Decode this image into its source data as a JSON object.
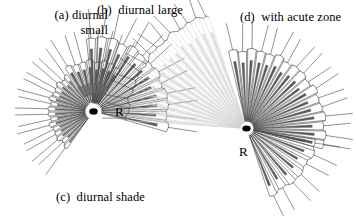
{
  "figure": {
    "background_color": "#ffffff",
    "ink_color": "#000000",
    "line_color": "#3a3a3a",
    "pale_ray_color": "#cfcfcf",
    "shade_fill_color": "#6e6e6e",
    "width": 356,
    "height": 216
  },
  "captions": [
    {
      "id": "a",
      "name": "caption-a-diurnal-small",
      "line1": "(a) diurnal",
      "line2": "small",
      "x": 18,
      "y": 8,
      "align": "right",
      "width": 90
    },
    {
      "id": "b",
      "name": "caption-b-diurnal-large",
      "line1": "(b)  diurnal large",
      "line2": "",
      "x": 97,
      "y": 3,
      "align": "left",
      "width": 120
    },
    {
      "id": "d",
      "name": "caption-d-with-acute-zone",
      "line1": "(d)  with acute zone",
      "line2": "",
      "x": 240,
      "y": 10,
      "align": "left",
      "width": 130
    },
    {
      "id": "c",
      "name": "caption-c-diurnal-shade",
      "line1": "(c)  diurnal shade",
      "line2": "",
      "x": 56,
      "y": 190,
      "align": "left",
      "width": 130
    }
  ],
  "hub_labels": [
    {
      "id": "R-left",
      "name": "rhabdom-label-left",
      "text": "R",
      "x": 115,
      "y": 104
    },
    {
      "id": "R-right",
      "name": "rhabdom-label-right",
      "text": "R",
      "x": 239,
      "y": 144
    }
  ],
  "eyes": [
    {
      "id": "left-eye",
      "name": "compound-eye-left",
      "center_x": 93.5,
      "center_y": 111.5,
      "sectors": [
        {
          "id": "a",
          "name": "sector-diurnal-small",
          "start_angle": 128,
          "end_angle": 232,
          "count": 16,
          "inner_radius": 8,
          "facet_radius": 44,
          "bristle_length": 34,
          "facet_half_width_deg": 2.6,
          "rhabdom_half_width_deg": 1.0,
          "rhabdom_dark": true,
          "shaded": false,
          "pale": false
        },
        {
          "id": "b",
          "name": "sector-diurnal-large",
          "start_angle": 268,
          "end_angle": 372,
          "count": 13,
          "inner_radius": 8,
          "facet_radius": 74,
          "bristle_length": 30,
          "facet_half_width_deg": 3.6,
          "rhabdom_half_width_deg": 1.1,
          "rhabdom_dark": true,
          "shaded": false,
          "pale": false
        },
        {
          "id": "c",
          "name": "sector-diurnal-shade",
          "start_angle": 240,
          "end_angle": 300,
          "count": 8,
          "inner_radius": 9,
          "facet_radius": 50,
          "bristle_length": 32,
          "facet_half_width_deg": 3.4,
          "rhabdom_half_width_deg": 1.6,
          "rhabdom_dark": true,
          "shaded": true,
          "shade_start_frac": 0.16,
          "shade_end_frac": 0.38,
          "pale": false
        }
      ]
    },
    {
      "id": "right-eye",
      "name": "compound-eye-right",
      "center_x": 246.5,
      "center_y": 128.5,
      "sectors": [
        {
          "id": "d-main",
          "name": "sector-main-fan",
          "start_angle": 260,
          "end_angle": 372,
          "count": 17,
          "inner_radius": 7,
          "facet_radius": 78,
          "bristle_length": 28,
          "facet_half_width_deg": 3.1,
          "rhabdom_half_width_deg": 1.0,
          "rhabdom_dark": true,
          "shaded": false,
          "pale": false
        },
        {
          "id": "d-lower",
          "name": "sector-lower-fan",
          "start_angle": 12,
          "end_angle": 68,
          "count": 7,
          "inner_radius": 7,
          "facet_radius": 70,
          "bristle_length": 26,
          "facet_half_width_deg": 3.2,
          "rhabdom_half_width_deg": 1.0,
          "rhabdom_dark": true,
          "shaded": false,
          "pale": false
        },
        {
          "id": "d-acute",
          "name": "sector-acute-zone",
          "start_angle": 185,
          "end_angle": 250,
          "count": 15,
          "inner_radius": 6,
          "facet_radius": 120,
          "bristle_length": 24,
          "facet_half_width_deg": 1.35,
          "rhabdom_half_width_deg": 0.45,
          "rhabdom_dark": false,
          "shaded": false,
          "pale": true
        }
      ]
    }
  ],
  "hub_dots": [
    {
      "name": "rhabdom-hub-left",
      "x": 93.5,
      "y": 111.5,
      "rx": 4.2,
      "ry": 3.2
    },
    {
      "name": "rhabdom-hub-right",
      "x": 246.5,
      "y": 128.5,
      "rx": 4.2,
      "ry": 3.0
    }
  ]
}
